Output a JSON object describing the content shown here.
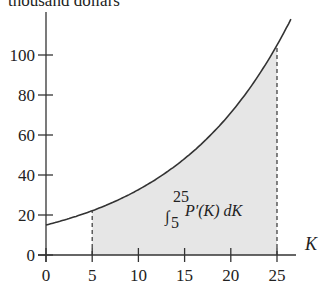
{
  "chart_data": {
    "type": "area",
    "title": "",
    "ylabel": "thousand dollars",
    "xlabel": "K",
    "x_ticks": [
      0,
      5,
      10,
      15,
      20,
      25
    ],
    "y_ticks": [
      0,
      20,
      40,
      60,
      80,
      100
    ],
    "xlim": [
      0,
      27
    ],
    "ylim": [
      0,
      120
    ],
    "series": [
      {
        "name": "P'(K)",
        "x": [
          0,
          5,
          10,
          15,
          20,
          25,
          26.5
        ],
        "values": [
          15,
          22.2,
          32.8,
          48.4,
          71.4,
          105.4,
          119
        ]
      }
    ],
    "shaded_region": {
      "from": 5,
      "to": 25
    },
    "annotation": "∫₅²⁵ P′(K) dK",
    "grid": false,
    "legend": null
  },
  "labels": {
    "ylabel": "thousand dollars",
    "xlabel": "K",
    "integral_sign": "∫",
    "integral_upper": "25",
    "integral_lower": "5",
    "integrand": "P′(K) dK"
  }
}
